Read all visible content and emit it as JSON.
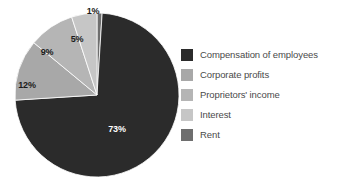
{
  "chart_data": {
    "type": "pie",
    "title": "",
    "categories": [
      "Compensation of employees",
      "Corporate profits",
      "Proprietors' income",
      "Interest",
      "Rent"
    ],
    "values": [
      73,
      12,
      9,
      5,
      1
    ],
    "value_labels": [
      "73%",
      "12%",
      "9%",
      "5%",
      "1%"
    ],
    "colors": [
      "#2b2b2b",
      "#a8a8a8",
      "#b5b5b5",
      "#c6c6c6",
      "#6e6e6e"
    ],
    "legend_position": "right",
    "grid": false,
    "xlabel": "",
    "ylabel": ""
  },
  "legend": {
    "items": [
      {
        "label": "Compensation of employees",
        "color": "#2b2b2b"
      },
      {
        "label": "Corporate profits",
        "color": "#a8a8a8"
      },
      {
        "label": "Proprietors' income",
        "color": "#b5b5b5"
      },
      {
        "label": "Interest",
        "color": "#c6c6c6"
      },
      {
        "label": "Rent",
        "color": "#6e6e6e"
      }
    ]
  },
  "pie": {
    "labels": [
      {
        "text": "1%",
        "x": 93,
        "y": 12,
        "tone": "dark"
      },
      {
        "text": "5%",
        "x": 77,
        "y": 40,
        "tone": "dark"
      },
      {
        "text": "9%",
        "x": 47,
        "y": 53,
        "tone": "dark"
      },
      {
        "text": "12%",
        "x": 27,
        "y": 86,
        "tone": "dark"
      },
      {
        "text": "73%",
        "x": 117,
        "y": 130,
        "tone": "light"
      }
    ]
  }
}
